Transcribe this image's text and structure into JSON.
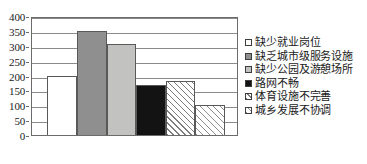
{
  "chart_data": {
    "type": "bar",
    "title": "",
    "subtitle": "",
    "xlabel": "",
    "ylabel": "",
    "ylim": [
      0,
      400
    ],
    "ytick_step": 50,
    "grid": true,
    "legend_position": "right",
    "categories": [
      "缺少就业岗位",
      "缺乏城市级服务设施",
      "缺少公园及游憩场所",
      "路网不畅",
      "体育设施不完善",
      "城乡发展不协调"
    ],
    "values": [
      200,
      350,
      307,
      168,
      183,
      100
    ],
    "ticks": [
      "0",
      "50",
      "100",
      "150",
      "200",
      "250",
      "300",
      "350",
      "400"
    ],
    "tick_values": [
      0,
      50,
      100,
      150,
      200,
      250,
      300,
      350,
      400
    ],
    "bar_fills": [
      "white",
      "mid",
      "lightmid",
      "black",
      "hatch-a",
      "hatch-b"
    ],
    "series": [
      {
        "name": "",
        "values": [
          200,
          350,
          307,
          168,
          183,
          100
        ]
      }
    ]
  },
  "legend": {
    "items": [
      {
        "label": "缺少就业岗位",
        "swatch": "legend-swatch-white",
        "fill": "fill-white"
      },
      {
        "label": "缺乏城市级服务设施",
        "swatch": "legend-swatch-mid",
        "fill": "fill-mid"
      },
      {
        "label": "缺少公园及游憩场所",
        "swatch": "legend-swatch-lightmid",
        "fill": "fill-lightmid"
      },
      {
        "label": "路网不畅",
        "swatch": "legend-swatch-black",
        "fill": "fill-black"
      },
      {
        "label": "体育设施不完善",
        "swatch": "legend-swatch-hatch-a",
        "fill": "fill-hatch-a"
      },
      {
        "label": "城乡发展不协调",
        "swatch": "legend-swatch-hatch-b",
        "fill": "fill-hatch-b"
      }
    ]
  },
  "colors": {
    "axis": "#6b6b6b",
    "grid": "#8a8a8a",
    "bar_border": "#595959",
    "background": "#ffffff",
    "text": "#1a1a1a"
  }
}
